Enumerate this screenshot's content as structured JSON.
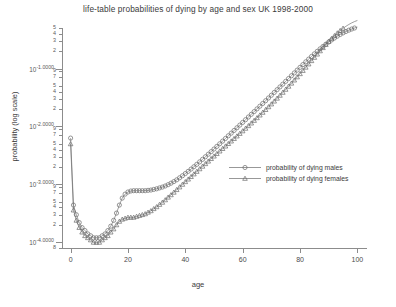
{
  "chart_data": {
    "type": "line",
    "title": "life-table probabilities of dying by age and sex UK 1998-2000",
    "xlabel": "age",
    "ylabel": "probability (log scale)",
    "yscale": "log",
    "xlim": [
      -3,
      103
    ],
    "ylim": [
      8e-05,
      0.5
    ],
    "xticks": [
      0,
      20,
      40,
      60,
      80,
      100
    ],
    "xticklabels": [
      "0",
      "20",
      "40",
      "60",
      "80",
      "100"
    ],
    "ymajor_ticks": [
      {
        "value": 0.1,
        "label": "10",
        "exponent": "-1.0000"
      },
      {
        "value": 0.01,
        "label": "10",
        "exponent": "-2.0000"
      },
      {
        "value": 0.001,
        "label": "10",
        "exponent": "-3.0000"
      },
      {
        "value": 0.0001,
        "label": "10",
        "exponent": "-4.0000"
      }
    ],
    "yminor_ticks": [
      {
        "value": 0.5,
        "label": "5"
      },
      {
        "value": 0.4,
        "label": "4"
      },
      {
        "value": 0.3,
        "label": "3"
      },
      {
        "value": 0.2,
        "label": "2"
      },
      {
        "value": 0.09,
        "label": "9"
      },
      {
        "value": 0.07,
        "label": "7"
      },
      {
        "value": 0.05,
        "label": "5"
      },
      {
        "value": 0.04,
        "label": "4"
      },
      {
        "value": 0.03,
        "label": "3"
      },
      {
        "value": 0.02,
        "label": "2"
      },
      {
        "value": 0.009,
        "label": "9"
      },
      {
        "value": 0.007,
        "label": "7"
      },
      {
        "value": 0.005,
        "label": "5"
      },
      {
        "value": 0.004,
        "label": "4"
      },
      {
        "value": 0.003,
        "label": "3"
      },
      {
        "value": 0.002,
        "label": "2"
      },
      {
        "value": 0.0009,
        "label": "9"
      },
      {
        "value": 0.0007,
        "label": "7"
      },
      {
        "value": 0.0005,
        "label": "5"
      },
      {
        "value": 0.0004,
        "label": "4"
      },
      {
        "value": 0.0003,
        "label": "3"
      },
      {
        "value": 0.0002,
        "label": "2"
      },
      {
        "value": 8e-05,
        "label": "8"
      }
    ],
    "grid": false,
    "legend_position": "center-right",
    "x": [
      0,
      1,
      2,
      3,
      4,
      5,
      6,
      7,
      8,
      9,
      10,
      11,
      12,
      13,
      14,
      15,
      16,
      17,
      18,
      19,
      20,
      21,
      22,
      23,
      24,
      25,
      26,
      27,
      28,
      29,
      30,
      31,
      32,
      33,
      34,
      35,
      36,
      37,
      38,
      39,
      40,
      41,
      42,
      43,
      44,
      45,
      46,
      47,
      48,
      49,
      50,
      51,
      52,
      53,
      54,
      55,
      56,
      57,
      58,
      59,
      60,
      61,
      62,
      63,
      64,
      65,
      66,
      67,
      68,
      69,
      70,
      71,
      72,
      73,
      74,
      75,
      76,
      77,
      78,
      79,
      80,
      81,
      82,
      83,
      84,
      85,
      86,
      87,
      88,
      89,
      90,
      91,
      92,
      93,
      94,
      95,
      96,
      97,
      98,
      99,
      100
    ],
    "series": [
      {
        "name": "probability of dying males",
        "marker": "circle",
        "color": "#6b6b6b",
        "values": [
          0.0063,
          0.00044,
          0.0003,
          0.00022,
          0.00018,
          0.00016,
          0.00014,
          0.00013,
          0.00012,
          0.00012,
          0.00012,
          0.00013,
          0.00014,
          0.00016,
          0.00019,
          0.00024,
          0.00032,
          0.00044,
          0.00058,
          0.00068,
          0.00074,
          0.00077,
          0.00078,
          0.00078,
          0.00078,
          0.00078,
          0.00078,
          0.00079,
          0.0008,
          0.00082,
          0.00084,
          0.00087,
          0.0009,
          0.00094,
          0.00099,
          0.00105,
          0.00112,
          0.0012,
          0.0013,
          0.00141,
          0.00154,
          0.00168,
          0.00184,
          0.00202,
          0.00222,
          0.00245,
          0.00271,
          0.003,
          0.00332,
          0.00368,
          0.00408,
          0.00453,
          0.00503,
          0.00559,
          0.00621,
          0.0069,
          0.00767,
          0.00853,
          0.00949,
          0.01056,
          0.01175,
          0.01308,
          0.01456,
          0.01621,
          0.01805,
          0.0201,
          0.02239,
          0.02495,
          0.02781,
          0.03101,
          0.03459,
          0.0386,
          0.04309,
          0.04812,
          0.05376,
          0.06007,
          0.06714,
          0.07505,
          0.08389,
          0.09376,
          0.10474,
          0.11692,
          0.13038,
          0.14518,
          0.16137,
          0.17897,
          0.19798,
          0.21835,
          0.24,
          0.26281,
          0.2866,
          0.31115,
          0.3362,
          0.36146,
          0.3866,
          0.4113,
          0.43523,
          0.45811,
          0.47966,
          0.49966,
          0.51792
        ]
      },
      {
        "name": "probability of dying females",
        "marker": "triangle",
        "color": "#6b6b6b",
        "values": [
          0.005,
          0.00036,
          0.00024,
          0.00018,
          0.00015,
          0.00013,
          0.00012,
          0.00011,
          0.0001,
          0.0001,
          0.0001,
          0.00011,
          0.00012,
          0.00013,
          0.00015,
          0.00017,
          0.0002,
          0.00023,
          0.00025,
          0.00026,
          0.00027,
          0.00027,
          0.00027,
          0.00028,
          0.00029,
          0.0003,
          0.00031,
          0.00033,
          0.00035,
          0.00038,
          0.00041,
          0.00045,
          0.00049,
          0.00054,
          0.0006,
          0.00066,
          0.00073,
          0.00081,
          0.0009,
          0.001,
          0.00111,
          0.00123,
          0.00136,
          0.00151,
          0.00167,
          0.00185,
          0.00205,
          0.00227,
          0.00251,
          0.00278,
          0.00307,
          0.00339,
          0.00375,
          0.00414,
          0.00457,
          0.00505,
          0.00558,
          0.00617,
          0.00682,
          0.00755,
          0.00836,
          0.00926,
          0.01027,
          0.0114,
          0.01267,
          0.01409,
          0.01568,
          0.01747,
          0.01949,
          0.02177,
          0.02435,
          0.02727,
          0.03059,
          0.03436,
          0.03866,
          0.04357,
          0.04918,
          0.0556,
          0.06295,
          0.07137,
          0.08103,
          0.09211,
          0.10481,
          0.11936,
          0.136,
          0.15497,
          0.17652,
          0.20088,
          0.22823,
          0.25868,
          0.29222,
          0.32867,
          0.36766,
          0.40862,
          0.4508,
          0.49327,
          0.535,
          0.57493,
          0.61205,
          0.64551,
          0.6747
        ]
      }
    ]
  },
  "legend": {
    "entries": [
      {
        "label": "probability of dying males"
      },
      {
        "label": "probability of dying females"
      }
    ]
  }
}
